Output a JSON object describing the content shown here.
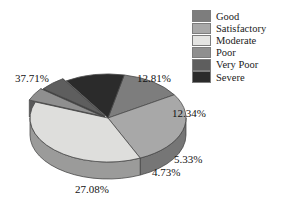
{
  "chart_data": {
    "type": "pie",
    "title": "",
    "subtitle": "",
    "xlabel": "",
    "ylabel": "",
    "grid": false,
    "three_d": true,
    "legend_position": "top-right",
    "value_suffix": "%",
    "categories": [
      "Good",
      "Satisfactory",
      "Moderate",
      "Poor",
      "Very Poor",
      "Severe"
    ],
    "values": [
      12.81,
      27.08,
      37.71,
      4.73,
      5.33,
      12.34
    ],
    "labels": [
      "12.81%",
      "27.08%",
      "37.71%",
      "4.73%",
      "5.33%",
      "12.34%"
    ],
    "colors": [
      "#7d7d7d",
      "#a8a8a8",
      "#dededc",
      "#8f8f8f",
      "#5e5e5e",
      "#2b2b2b"
    ],
    "slices": [
      {
        "name": "Good",
        "value": 12.81,
        "label": "12.81%",
        "color": "#7d7d7d"
      },
      {
        "name": "Satisfactory",
        "value": 27.08,
        "label": "27.08%",
        "color": "#a8a8a8"
      },
      {
        "name": "Moderate",
        "value": 37.71,
        "label": "37.71%",
        "color": "#dededc"
      },
      {
        "name": "Poor",
        "value": 4.73,
        "label": "4.73%",
        "color": "#8f8f8f"
      },
      {
        "name": "Very Poor",
        "value": 5.33,
        "label": "5.33%",
        "color": "#5e5e5e"
      },
      {
        "name": "Severe",
        "value": 12.34,
        "label": "12.34%",
        "color": "#2b2b2b"
      }
    ]
  },
  "legend": {
    "items": [
      {
        "label": "Good",
        "color": "#7d7d7d"
      },
      {
        "label": "Satisfactory",
        "color": "#a8a8a8"
      },
      {
        "label": "Moderate",
        "color": "#e4e4e2"
      },
      {
        "label": "Poor",
        "color": "#8f8f8f"
      },
      {
        "label": "Very Poor",
        "color": "#5e5e5e"
      },
      {
        "label": "Severe",
        "color": "#2b2b2b"
      }
    ]
  }
}
